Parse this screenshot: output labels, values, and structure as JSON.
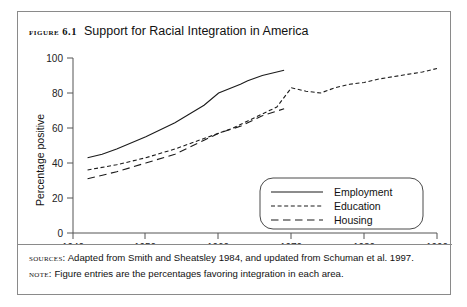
{
  "figure": {
    "label": "Figure 6.1",
    "title": "Support for Racial Integration in America",
    "sources_key": "Sources:",
    "sources_text": "Adapted from Smith and Sheatsley 1984, and updated from Schuman et al. 1997.",
    "note_key": "Note:",
    "note_text": "Figure entries are the percentages favoring integration in each area."
  },
  "chart_data": {
    "type": "line",
    "title": "Support for Racial Integration in America",
    "xlabel": "",
    "ylabel": "Percentage positive",
    "xlim": [
      1940,
      1990
    ],
    "ylim": [
      0,
      100
    ],
    "xticks": [
      1940,
      1950,
      1960,
      1970,
      1980,
      1990
    ],
    "yticks": [
      0,
      20,
      40,
      60,
      80,
      100
    ],
    "grid": false,
    "legend_position": "lower right",
    "series": [
      {
        "name": "Employment",
        "style": "solid",
        "x": [
          1942,
          1944,
          1946,
          1950,
          1954,
          1956,
          1958,
          1960,
          1963,
          1964,
          1966,
          1969
        ],
        "values": [
          43,
          45,
          48,
          55,
          63,
          68,
          73,
          80,
          85,
          87,
          90,
          93
        ]
      },
      {
        "name": "Education",
        "style": "dotted",
        "x": [
          1942,
          1946,
          1950,
          1954,
          1956,
          1958,
          1960,
          1962,
          1963,
          1964,
          1966,
          1968,
          1970,
          1972,
          1974,
          1976,
          1978,
          1980,
          1982,
          1985,
          1988,
          1990
        ],
        "values": [
          36,
          39,
          43,
          48,
          51,
          54,
          57,
          60,
          62,
          64,
          68,
          72,
          83,
          81,
          80,
          83,
          85,
          86,
          88,
          90,
          92,
          94
        ]
      },
      {
        "name": "Housing",
        "style": "dashed",
        "x": [
          1942,
          1946,
          1950,
          1954,
          1956,
          1958,
          1960,
          1963,
          1964,
          1966,
          1969
        ],
        "values": [
          31,
          35,
          40,
          45,
          49,
          53,
          57,
          61,
          63,
          67,
          71
        ]
      }
    ]
  },
  "legend": {
    "items": [
      {
        "label": "Employment",
        "style": "solid"
      },
      {
        "label": "Education",
        "style": "dotted"
      },
      {
        "label": "Housing",
        "style": "dashed"
      }
    ]
  }
}
